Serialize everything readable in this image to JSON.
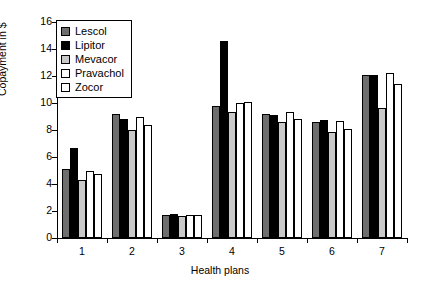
{
  "chart_data": {
    "type": "bar",
    "title": "",
    "xlabel": "Health plans",
    "ylabel": "Copayment in $",
    "categories": [
      "1",
      "2",
      "3",
      "4",
      "5",
      "6",
      "7"
    ],
    "ylim": [
      0,
      16
    ],
    "yticks": [
      0,
      2,
      4,
      6,
      8,
      10,
      12,
      14,
      16
    ],
    "grid": false,
    "legend_position": "top-left",
    "series": [
      {
        "name": "Lescol",
        "color": "#6e6e6e",
        "values": [
          5.1,
          9.2,
          1.7,
          9.8,
          9.15,
          8.6,
          12.1
        ]
      },
      {
        "name": "Lipitor",
        "color": "#000000",
        "values": [
          6.7,
          8.85,
          1.75,
          14.6,
          9.1,
          8.75,
          12.1
        ]
      },
      {
        "name": "Mevacor",
        "color": "#c9c9c9",
        "values": [
          4.3,
          8.0,
          1.65,
          9.3,
          8.6,
          7.85,
          9.6
        ]
      },
      {
        "name": "Pravachol",
        "color": "#ffffff",
        "values": [
          5.0,
          8.95,
          1.7,
          10.0,
          9.3,
          8.7,
          12.2
        ]
      },
      {
        "name": "Zocor",
        "color": "#ffffff",
        "values": [
          4.75,
          8.4,
          1.7,
          10.05,
          8.8,
          8.1,
          11.4
        ]
      }
    ]
  },
  "legend": {
    "items": [
      {
        "label": "Lescol"
      },
      {
        "label": "Lipitor"
      },
      {
        "label": "Mevacor"
      },
      {
        "label": "Pravachol"
      },
      {
        "label": "Zocor"
      }
    ]
  },
  "axes": {
    "y_title": "Copayment in $",
    "x_title": "Health plans"
  }
}
